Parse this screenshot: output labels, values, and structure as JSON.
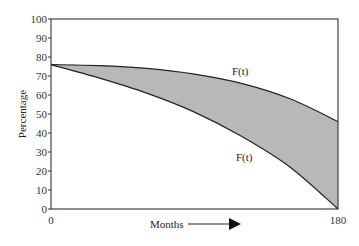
{
  "chart_data": {
    "type": "area",
    "title": "",
    "xlabel": "Months",
    "ylabel": "Percentage",
    "xlim": [
      0,
      180
    ],
    "ylim": [
      0,
      100
    ],
    "x_ticks": [
      0,
      180
    ],
    "y_ticks": [
      0,
      10,
      20,
      30,
      40,
      50,
      60,
      70,
      80,
      90,
      100
    ],
    "grid": false,
    "legend": null,
    "x": [
      0,
      30,
      60,
      90,
      120,
      150,
      180
    ],
    "series": [
      {
        "name": "F(t) upper",
        "values": [
          76,
          75.5,
          74,
          71,
          66,
          58,
          46
        ]
      },
      {
        "name": "F(t) lower",
        "values": [
          76,
          69,
          61,
          51,
          38,
          22,
          0
        ]
      }
    ],
    "fill_between": {
      "color": "#b8b8b8"
    },
    "annotations": [
      {
        "text": "F(t)",
        "x": 117,
        "y": 80
      },
      {
        "text": "F(t)",
        "x": 120,
        "y": 38
      },
      {
        "text": "Months →",
        "position": "below x-axis with arrow"
      }
    ]
  },
  "labels": {
    "ylabel": "Percentage",
    "xlabel": "Months",
    "upper_curve": "F(t)",
    "lower_curve": "F(t)",
    "x0": "0",
    "x180": "180"
  }
}
